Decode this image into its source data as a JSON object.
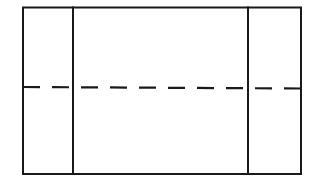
{
  "diagram": {
    "panels": [
      {
        "name": "left-panel"
      },
      {
        "name": "center-panel"
      },
      {
        "name": "right-panel"
      }
    ],
    "lines": {
      "vertical_dividers": 2,
      "horizontal_dashed": 1,
      "line_color": "#1a1a1a",
      "background_color": "#ffffff"
    }
  }
}
